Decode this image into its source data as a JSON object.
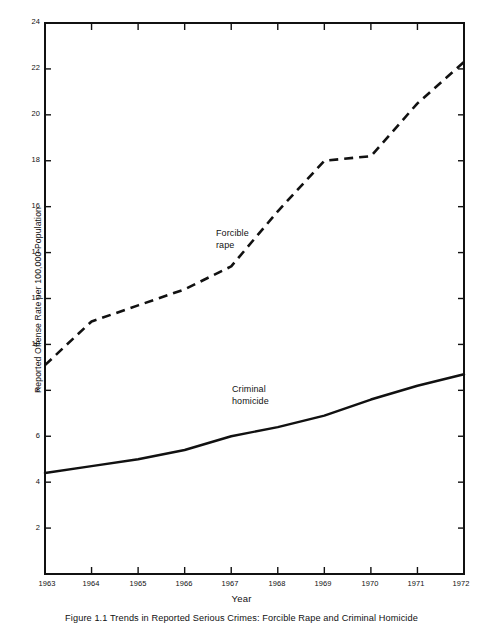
{
  "figure": {
    "caption": "Figure 1.1  Trends in Reported Serious Crimes: Forcible Rape and Criminal Homicide"
  },
  "chart_data": {
    "type": "line",
    "title": "",
    "xlabel": "Year",
    "ylabel": "Reported Offense Rate per 100,000 Population",
    "categories": [
      "1963",
      "1964",
      "1965",
      "1966",
      "1967",
      "1968",
      "1969",
      "1970",
      "1971",
      "1972"
    ],
    "x": [
      1963,
      1964,
      1965,
      1966,
      1967,
      1968,
      1969,
      1970,
      1971,
      1972
    ],
    "xlim": [
      1963,
      1972
    ],
    "ylim": [
      0,
      24
    ],
    "yticks": [
      2,
      4,
      6,
      8,
      10,
      12,
      14,
      16,
      18,
      20,
      22,
      24
    ],
    "ytick_labels": [
      "2",
      "4",
      "6",
      "8",
      "10",
      "12",
      "14",
      "16",
      "18",
      "20",
      "22",
      "24"
    ],
    "xticks": [
      1963,
      1964,
      1965,
      1966,
      1967,
      1968,
      1969,
      1970,
      1971,
      1972
    ],
    "grid": false,
    "legend_position": "inline-annotations",
    "series": [
      {
        "name": "Forcible rape",
        "style": "dashed",
        "color": "#111111",
        "annotation": "Forcible\nrape",
        "annotation_line1": "Forcible",
        "annotation_line2": "rape",
        "values": [
          9.1,
          11.0,
          11.7,
          12.4,
          13.4,
          15.8,
          18.0,
          18.2,
          20.5,
          22.3
        ]
      },
      {
        "name": "Criminal homicide",
        "style": "solid",
        "color": "#111111",
        "annotation": "Criminal\nhomicide",
        "annotation_line1": "Criminal",
        "annotation_line2": "homicide",
        "values": [
          4.4,
          4.7,
          5.0,
          5.4,
          6.0,
          6.4,
          6.9,
          7.6,
          8.2,
          8.7
        ]
      }
    ]
  },
  "axes": {
    "y_title": "Reported Offense Rate per 100,000 Population",
    "x_title": "Year",
    "y_labels": [
      "24",
      "22",
      "20",
      "18",
      "16",
      "14",
      "12",
      "10",
      "8",
      "6",
      "4",
      "2"
    ],
    "x_labels": [
      "1963",
      "1964",
      "1965",
      "1966",
      "1967",
      "1968",
      "1969",
      "1970",
      "1971",
      "1972"
    ]
  }
}
